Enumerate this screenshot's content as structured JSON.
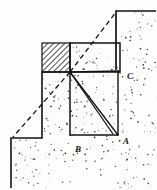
{
  "figure": {
    "background_color": "#fdfdfb",
    "ink_color": "#141210",
    "stipple_color": "#3a332c",
    "hatch_color": "#1a1714"
  },
  "labels": [
    {
      "id": "A",
      "text": "A",
      "x": 123,
      "y": 144
    },
    {
      "id": "B",
      "text": "B",
      "x": 75,
      "y": 152
    },
    {
      "id": "C",
      "text": "C",
      "x": 127,
      "y": 79
    }
  ],
  "geometry": {
    "vertex": {
      "x": 70,
      "y": 72
    },
    "ground_profile": [
      {
        "x": 11,
        "y": 138
      },
      {
        "x": 11,
        "y": 188
      },
      {
        "x": 116,
        "y": 11
      },
      {
        "x": 156,
        "y": 11
      }
    ],
    "step_outline": [
      {
        "x": 10,
        "y": 138
      },
      {
        "x": 42,
        "y": 138
      },
      {
        "x": 42,
        "y": 72
      },
      {
        "x": 70,
        "y": 72
      },
      {
        "x": 70,
        "y": 43
      },
      {
        "x": 97,
        "y": 43
      },
      {
        "x": 120,
        "y": 70
      },
      {
        "x": 116,
        "y": 11
      }
    ],
    "hatched_block": {
      "x": 42,
      "y": 43,
      "width": 28,
      "height": 29
    },
    "wedge_triangle": [
      {
        "x": 70,
        "y": 72
      },
      {
        "x": 118,
        "y": 135
      },
      {
        "x": 70,
        "y": 135
      }
    ],
    "dashed_planes": [
      {
        "from": {
          "x": 70,
          "y": 72
        },
        "to": {
          "x": 13,
          "y": 137
        }
      },
      {
        "from": {
          "x": 70,
          "y": 72
        },
        "to": {
          "x": 116,
          "y": 12
        }
      }
    ],
    "rays_from_vertex": [
      {
        "to": {
          "x": 118,
          "y": 135
        }
      },
      {
        "to": {
          "x": 113,
          "y": 135
        }
      },
      {
        "to": {
          "x": 120,
          "y": 70
        }
      }
    ]
  },
  "stipple": {
    "dot_count": 430,
    "dot_radius": 0.55,
    "seed": 20240917
  }
}
